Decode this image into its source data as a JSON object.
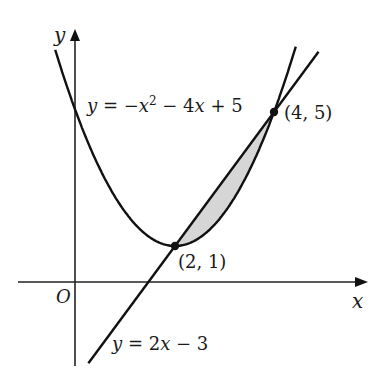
{
  "chart_data": {
    "type": "line",
    "title": "",
    "xlabel": "x",
    "ylabel": "y",
    "origin_label": "O",
    "series": [
      {
        "name": "y = -x^2 - 4x + 5 (curve, vertex at (2,1))",
        "label": "y = −x² − 4x + 5",
        "kind": "parabola",
        "vertex": [
          2,
          1
        ],
        "passes_through": [
          [
            0,
            5
          ],
          [
            2,
            1
          ],
          [
            4,
            5
          ]
        ]
      },
      {
        "name": "y = 2x - 3",
        "label": "y = 2x − 3",
        "kind": "line",
        "slope": 2,
        "intercept": -3,
        "passes_through": [
          [
            1.5,
            0
          ],
          [
            2,
            1
          ],
          [
            4,
            5
          ]
        ]
      }
    ],
    "points": [
      {
        "label": "(2, 1)",
        "x": 2,
        "y": 1
      },
      {
        "label": "(4, 5)",
        "x": 4,
        "y": 5
      }
    ],
    "shaded_region": {
      "between": [
        "line",
        "parabola"
      ],
      "x_range": [
        2,
        4
      ],
      "color": "#d6d6d6"
    },
    "grid": false,
    "ticks": false
  },
  "labels": {
    "y_axis": "y",
    "x_axis": "x",
    "origin": "O",
    "curve_eq": "y = −x² − 4x + 5",
    "line_eq": "y = 2x − 3",
    "point_a": "(2, 1)",
    "point_b": "(4, 5)"
  },
  "colors": {
    "ink": "#111111",
    "shade": "#d6d6d6",
    "background": "#ffffff"
  }
}
